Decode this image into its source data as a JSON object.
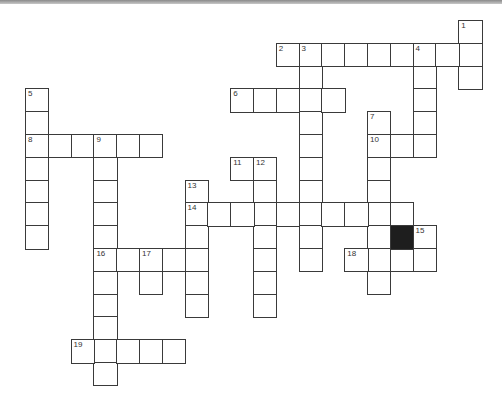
{
  "puzzle": {
    "type": "crossword",
    "cell_size": 22.8,
    "origin": {
      "x": 25,
      "y": 20
    },
    "colors": {
      "border": "#3a3a3a",
      "fill": "#ffffff",
      "black": "#1e1e1e",
      "topbar": "#8a8a8a"
    },
    "entries": [
      {
        "number": "1",
        "direction": "down",
        "row": 0,
        "col": 19,
        "length": 3
      },
      {
        "number": "2",
        "direction": "across",
        "row": 1,
        "col": 11,
        "length": 9
      },
      {
        "number": "3",
        "direction": "down",
        "row": 1,
        "col": 12,
        "length": 10
      },
      {
        "number": "4",
        "direction": "down",
        "row": 1,
        "col": 17,
        "length": 5
      },
      {
        "number": "5",
        "direction": "down",
        "row": 3,
        "col": 0,
        "length": 7
      },
      {
        "number": "6",
        "direction": "across",
        "row": 3,
        "col": 9,
        "length": 5
      },
      {
        "number": "7",
        "direction": "down",
        "row": 4,
        "col": 15,
        "length": 8
      },
      {
        "number": "8",
        "direction": "across",
        "row": 5,
        "col": 0,
        "length": 6
      },
      {
        "number": "9",
        "direction": "down",
        "row": 5,
        "col": 3,
        "length": 11
      },
      {
        "number": "10",
        "direction": "across",
        "row": 5,
        "col": 15,
        "length": 3
      },
      {
        "number": "11",
        "direction": "across",
        "row": 6,
        "col": 9,
        "length": 2
      },
      {
        "number": "12",
        "direction": "down",
        "row": 6,
        "col": 10,
        "length": 7
      },
      {
        "number": "13",
        "direction": "down",
        "row": 7,
        "col": 7,
        "length": 6
      },
      {
        "number": "14",
        "direction": "across",
        "row": 8,
        "col": 7,
        "length": 10
      },
      {
        "number": "15",
        "direction": "down",
        "row": 9,
        "col": 17,
        "length": 2
      },
      {
        "number": "16",
        "direction": "across",
        "row": 10,
        "col": 3,
        "length": 5
      },
      {
        "number": "17",
        "direction": "down",
        "row": 10,
        "col": 5,
        "length": 2
      },
      {
        "number": "18",
        "direction": "across",
        "row": 10,
        "col": 14,
        "length": 4
      },
      {
        "number": "19",
        "direction": "across",
        "row": 14,
        "col": 2,
        "length": 5
      }
    ],
    "black_cells": [
      {
        "row": 9,
        "col": 16
      }
    ]
  }
}
